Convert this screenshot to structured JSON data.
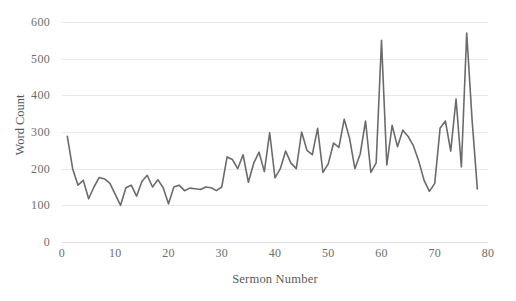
{
  "chart_data": {
    "type": "line",
    "title": "",
    "xlabel": "Sermon Number",
    "ylabel": "Word Count",
    "xlim": [
      0,
      80
    ],
    "ylim": [
      0,
      600
    ],
    "xticks": [
      0,
      10,
      20,
      30,
      40,
      50,
      60,
      70,
      80
    ],
    "yticks": [
      0,
      100,
      200,
      300,
      400,
      500,
      600
    ],
    "xtick_labels": [
      "0",
      "10",
      "20",
      "30",
      "40",
      "50",
      "60",
      "70",
      "80"
    ],
    "ytick_labels": [
      "0",
      "100",
      "200",
      "300",
      "400",
      "500",
      "600"
    ],
    "grid": "horizontal",
    "legend": "none",
    "line_color": "#6b6b6b",
    "line_width": 1.6,
    "markers": "none",
    "series": [
      {
        "name": "Word Count",
        "x": [
          1,
          2,
          3,
          4,
          5,
          6,
          7,
          8,
          9,
          10,
          11,
          12,
          13,
          14,
          15,
          16,
          17,
          18,
          19,
          20,
          21,
          22,
          23,
          24,
          25,
          26,
          27,
          28,
          29,
          30,
          31,
          32,
          33,
          34,
          35,
          36,
          37,
          38,
          39,
          40,
          41,
          42,
          43,
          44,
          45,
          46,
          47,
          48,
          49,
          50,
          51,
          52,
          53,
          54,
          55,
          56,
          57,
          58,
          59,
          60,
          61,
          62,
          63,
          64,
          65,
          66,
          67,
          68,
          69,
          70,
          71,
          72,
          73,
          74,
          75,
          76,
          77,
          78
        ],
        "values": [
          288,
          200,
          155,
          168,
          118,
          150,
          176,
          172,
          160,
          130,
          100,
          148,
          155,
          125,
          165,
          182,
          150,
          170,
          148,
          104,
          150,
          155,
          140,
          147,
          145,
          143,
          150,
          148,
          140,
          150,
          232,
          225,
          200,
          238,
          163,
          215,
          245,
          192,
          298,
          175,
          200,
          248,
          215,
          200,
          300,
          250,
          238,
          310,
          190,
          213,
          270,
          258,
          335,
          283,
          200,
          240,
          330,
          190,
          216,
          550,
          210,
          318,
          260,
          305,
          288,
          262,
          220,
          168,
          138,
          160,
          310,
          330,
          248,
          390,
          205,
          570,
          335,
          145
        ]
      }
    ]
  },
  "axes": {
    "y_title": "Word Count",
    "x_title": "Sermon Number"
  }
}
